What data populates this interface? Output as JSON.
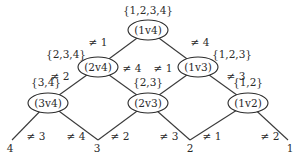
{
  "diagram": {
    "nodes": [
      {
        "id": "n1v4",
        "label": "(1v4)",
        "set": "{1,2,3,4}"
      },
      {
        "id": "n2v4",
        "label": "(2v4)",
        "set": "{2,3,4}"
      },
      {
        "id": "n1v3",
        "label": "(1v3)",
        "set": "{1,2,3}"
      },
      {
        "id": "n3v4",
        "label": "(3v4)",
        "set": "{3,4}"
      },
      {
        "id": "n2v3",
        "label": "(2v3)",
        "set": "{2,3}"
      },
      {
        "id": "n1v2",
        "label": "(1v2)",
        "set": "{1,2}"
      }
    ],
    "leaves": [
      "4",
      "3",
      "2",
      "1"
    ],
    "edge_labels": {
      "e_1v4_2v4": "≠ 1",
      "e_1v4_1v3": "≠ 4",
      "e_2v4_3v4": "≠ 2",
      "e_2v4_2v3": "≠ 4",
      "e_1v3_2v3": "≠ 1",
      "e_1v3_1v2": "≠ 3",
      "e_3v4_leaf4": "≠ 3",
      "e_3v4_leaf3": "≠ 4",
      "e_2v3_leaf3": "≠ 2",
      "e_2v3_leaf2": "≠ 3",
      "e_1v2_leaf2": "≠ 1",
      "e_1v2_leaf1": "≠ 2"
    },
    "edge_symbol": "非"
  }
}
